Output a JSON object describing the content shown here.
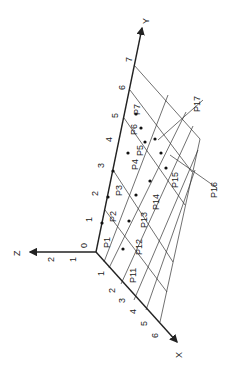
{
  "diagram": {
    "axes": {
      "x": {
        "label": "X",
        "ticks": [
          "1",
          "2",
          "3",
          "4",
          "5",
          "6"
        ]
      },
      "y": {
        "label": "Y",
        "ticks": [
          "0",
          "1",
          "2",
          "3",
          "4",
          "5",
          "6",
          "7"
        ]
      },
      "z": {
        "label": "Z",
        "ticks": [
          "1",
          "2"
        ]
      }
    },
    "points": {
      "row1": [
        "P1",
        "P2",
        "P3",
        "P4",
        "P5",
        "P6",
        "P7"
      ],
      "row2": [
        "P11",
        "P12",
        "P13",
        "P14",
        "P15"
      ],
      "callouts": [
        "P16",
        "P17"
      ]
    }
  }
}
